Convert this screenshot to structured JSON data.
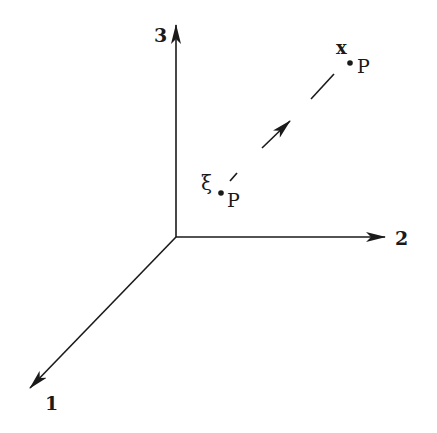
{
  "figure": {
    "colors": {
      "ink": "#1a1a1a",
      "background": "#ffffff"
    },
    "axes": [
      {
        "id": "axis-1",
        "label": "1",
        "direction": "down-left"
      },
      {
        "id": "axis-2",
        "label": "2",
        "direction": "right"
      },
      {
        "id": "axis-3",
        "label": "3",
        "direction": "up"
      }
    ],
    "points": {
      "current": {
        "symbol": "x",
        "subscript": "P"
      },
      "reference": {
        "symbol": "ξ",
        "subscript": "P"
      }
    },
    "path": {
      "style": "dashed",
      "arrow_direction": "from reference to current"
    }
  }
}
